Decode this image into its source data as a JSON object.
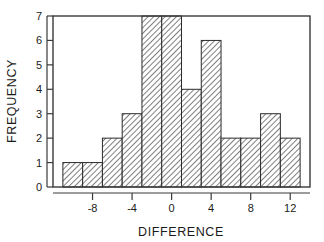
{
  "chart_data": {
    "type": "bar",
    "title": "",
    "subtitle": "",
    "xlabel": "DIFFERENCE",
    "ylabel": "FREQUENCY",
    "xlim": [
      -12,
      14
    ],
    "ylim": [
      0,
      7
    ],
    "bin_width": 2,
    "grid": false,
    "legend": null,
    "x_ticks": [
      -8,
      -4,
      0,
      4,
      8,
      12
    ],
    "x_tick_labels": [
      "-8",
      "-4",
      "0",
      "4",
      "8",
      "12"
    ],
    "y_ticks": [
      0,
      1,
      2,
      3,
      4,
      5,
      6,
      7
    ],
    "y_tick_labels": [
      "0",
      "1",
      "2",
      "3",
      "4",
      "5",
      "6",
      "7"
    ],
    "bin_edges": [
      -11,
      -9,
      -7,
      -5,
      -3,
      -1,
      1,
      3,
      5,
      7,
      9,
      11,
      13
    ],
    "categories": [
      "-11 to -9",
      "-9 to -7",
      "-7 to -5",
      "-5 to -3",
      "-3 to -1",
      "-1 to 1",
      "1 to 3",
      "3 to 5",
      "5 to 7",
      "7 to 9",
      "9 to 11",
      "11 to 13"
    ],
    "values": [
      1,
      1,
      2,
      3,
      7,
      7,
      4,
      6,
      2,
      2,
      3,
      2
    ],
    "bar_fill": "#ffffff",
    "bar_hatch": "diagonal-forward",
    "bar_edge_color": "#2b2b2b",
    "frame_color": "#3a3a3a",
    "background": "#ffffff"
  }
}
